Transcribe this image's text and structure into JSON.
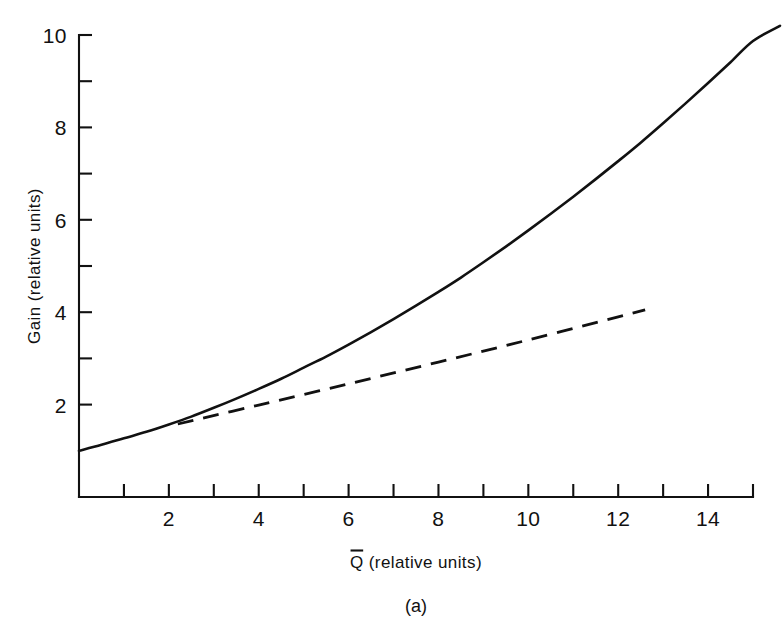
{
  "chart_data": {
    "type": "line",
    "title": "",
    "subtitle": "",
    "caption": "(a)",
    "xlabel": "Q̅ (relative units)",
    "xlabel_base": "Q",
    "xlabel_rest": " (relative units)",
    "ylabel": "Gain (relative units)",
    "xlim": [
      0,
      15.6
    ],
    "ylim": [
      0,
      10.4
    ],
    "grid": false,
    "legend": null,
    "x_major_ticks": [
      2,
      4,
      6,
      8,
      10,
      12,
      14
    ],
    "x_minor_ticks": [
      1,
      3,
      5,
      7,
      9,
      11,
      13,
      15
    ],
    "x_tick_labels": [
      "2",
      "4",
      "6",
      "8",
      "10",
      "12",
      "14"
    ],
    "y_major_ticks": [
      2,
      4,
      6,
      8,
      10
    ],
    "y_minor_ticks": [
      3,
      5,
      7,
      9
    ],
    "y_tick_labels": [
      "2",
      "4",
      "6",
      "8",
      "10"
    ],
    "series": [
      {
        "name": "solid-curve",
        "style": "solid",
        "color": "#111111",
        "x": [
          0.0,
          0.5,
          1.0,
          1.5,
          2.0,
          2.5,
          3.0,
          3.5,
          4.0,
          4.5,
          5.0,
          5.5,
          6.0,
          6.5,
          7.0,
          7.5,
          8.0,
          8.5,
          9.0,
          9.5,
          10.0,
          10.5,
          11.0,
          11.5,
          12.0,
          12.5,
          13.0,
          13.5,
          14.0,
          14.5,
          15.0,
          15.6
        ],
        "y": [
          1.0,
          1.13,
          1.27,
          1.41,
          1.57,
          1.74,
          1.93,
          2.13,
          2.34,
          2.56,
          2.8,
          3.04,
          3.3,
          3.57,
          3.85,
          4.14,
          4.44,
          4.75,
          5.08,
          5.42,
          5.77,
          6.13,
          6.5,
          6.88,
          7.27,
          7.67,
          8.09,
          8.52,
          8.96,
          9.41,
          9.87,
          10.2
        ]
      },
      {
        "name": "dashed-line",
        "style": "dashed",
        "color": "#111111",
        "x": [
          2.2,
          4.0,
          6.0,
          8.0,
          10.0,
          12.0,
          12.6
        ],
        "y": [
          1.58,
          1.99,
          2.45,
          2.92,
          3.4,
          3.9,
          4.05
        ]
      }
    ]
  },
  "figure": {
    "caption": "(a)"
  }
}
